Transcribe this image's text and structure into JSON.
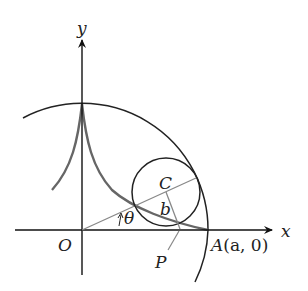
{
  "figure": {
    "type": "hypocycloid (astroid) construction",
    "labels": {
      "y_axis": "y",
      "x_axis": "x",
      "origin": "O",
      "center": "C",
      "radius_small": "b",
      "angle": "θ",
      "point_p": "P",
      "point_a_name": "A",
      "point_a_coords": "(a, 0)"
    },
    "colors": {
      "axis": "#111111",
      "big_circle": "#222222",
      "small_circle": "#222222",
      "astroid": "#666666",
      "radius_line": "#888888"
    }
  }
}
